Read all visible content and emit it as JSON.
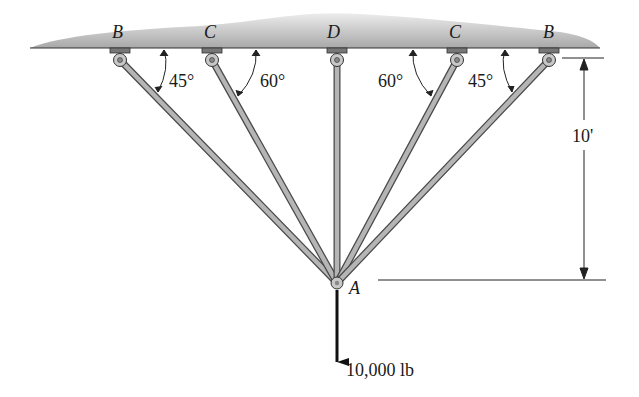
{
  "diagram": {
    "type": "statics-truss",
    "ceiling": {
      "color": "#b9b9b9"
    },
    "supports": [
      {
        "id": "B1",
        "label": "B",
        "x": 120
      },
      {
        "id": "C1",
        "label": "C",
        "x": 212
      },
      {
        "id": "D",
        "label": "D",
        "x": 337
      },
      {
        "id": "C2",
        "label": "C",
        "x": 457
      },
      {
        "id": "B2",
        "label": "B",
        "x": 549
      }
    ],
    "angles": [
      {
        "label": "45°",
        "x": 165,
        "y": 82
      },
      {
        "label": "60°",
        "x": 259,
        "y": 82
      },
      {
        "label": "60°",
        "x": 378,
        "y": 82
      },
      {
        "label": "45°",
        "x": 469,
        "y": 82
      }
    ],
    "joint": {
      "label": "A"
    },
    "dimension": {
      "label": "10'"
    },
    "load": {
      "label": "10,000 lb"
    },
    "colors": {
      "member": "#a9a9a9",
      "member_edge": "#4a4a4a",
      "arrow": "#111111"
    }
  }
}
